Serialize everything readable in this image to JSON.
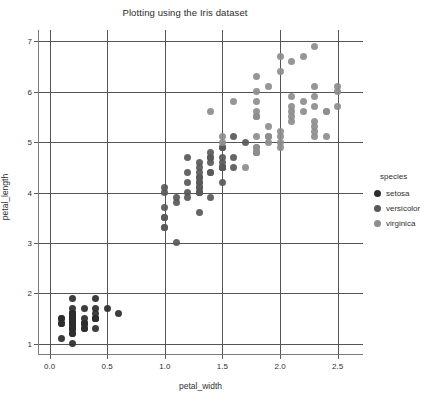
{
  "chart_data": {
    "type": "scatter",
    "title": "Plotting using the Iris dataset",
    "xlabel": "petal_width",
    "ylabel": "petal_length",
    "xlim": [
      -0.1,
      2.72
    ],
    "ylim": [
      0.78,
      7.22
    ],
    "xticks": [
      "0.0",
      "0.5",
      "1.0",
      "1.5",
      "2.0",
      "2.5"
    ],
    "xtick_values": [
      0.0,
      0.5,
      1.0,
      1.5,
      2.0,
      2.5
    ],
    "yticks": [
      "1",
      "2",
      "3",
      "4",
      "5",
      "6",
      "7"
    ],
    "ytick_values": [
      1,
      2,
      3,
      4,
      5,
      6,
      7
    ],
    "grid": true,
    "legend_position": "right",
    "legend_title": "species",
    "marker": "circle",
    "marker_size": 7,
    "series": [
      {
        "name": "setosa",
        "color": "#2d2d2d",
        "x": [
          0.2,
          0.2,
          0.2,
          0.2,
          0.2,
          0.4,
          0.3,
          0.2,
          0.2,
          0.1,
          0.2,
          0.2,
          0.1,
          0.1,
          0.2,
          0.4,
          0.4,
          0.3,
          0.3,
          0.3,
          0.2,
          0.4,
          0.2,
          0.5,
          0.2,
          0.2,
          0.4,
          0.2,
          0.2,
          0.2,
          0.2,
          0.4,
          0.1,
          0.2,
          0.2,
          0.2,
          0.2,
          0.1,
          0.2,
          0.2,
          0.3,
          0.3,
          0.2,
          0.6,
          0.4,
          0.3,
          0.2,
          0.2,
          0.2,
          0.2
        ],
        "y": [
          1.4,
          1.4,
          1.3,
          1.5,
          1.4,
          1.7,
          1.4,
          1.5,
          1.4,
          1.5,
          1.5,
          1.6,
          1.4,
          1.1,
          1.2,
          1.5,
          1.3,
          1.4,
          1.7,
          1.5,
          1.7,
          1.5,
          1.0,
          1.7,
          1.9,
          1.6,
          1.6,
          1.5,
          1.4,
          1.6,
          1.6,
          1.5,
          1.5,
          1.4,
          1.5,
          1.2,
          1.3,
          1.4,
          1.3,
          1.5,
          1.3,
          1.3,
          1.3,
          1.6,
          1.9,
          1.4,
          1.6,
          1.4,
          1.5,
          1.4
        ]
      },
      {
        "name": "versicolor",
        "color": "#595959",
        "x": [
          1.4,
          1.5,
          1.5,
          1.3,
          1.5,
          1.3,
          1.6,
          1.0,
          1.3,
          1.4,
          1.0,
          1.5,
          1.0,
          1.4,
          1.3,
          1.4,
          1.5,
          1.0,
          1.5,
          1.1,
          1.8,
          1.3,
          1.5,
          1.2,
          1.3,
          1.4,
          1.4,
          1.7,
          1.5,
          1.0,
          1.1,
          1.0,
          1.2,
          1.6,
          1.5,
          1.6,
          1.5,
          1.3,
          1.3,
          1.3,
          1.2,
          1.4,
          1.2,
          1.0,
          1.3,
          1.2,
          1.3,
          1.3,
          1.1,
          1.3
        ],
        "y": [
          4.7,
          4.5,
          4.9,
          4.0,
          4.6,
          4.5,
          4.7,
          3.3,
          4.6,
          3.9,
          3.5,
          4.2,
          4.0,
          4.7,
          3.6,
          4.4,
          4.5,
          4.1,
          4.5,
          3.9,
          4.8,
          4.0,
          4.9,
          4.7,
          4.3,
          4.4,
          4.8,
          5.0,
          4.5,
          3.5,
          3.8,
          3.7,
          3.9,
          5.1,
          4.5,
          4.5,
          4.7,
          4.4,
          4.1,
          4.0,
          4.4,
          4.6,
          4.0,
          3.3,
          4.2,
          4.2,
          4.2,
          4.3,
          3.0,
          4.1
        ]
      },
      {
        "name": "virginica",
        "color": "#8d8d8d",
        "x": [
          2.5,
          1.9,
          2.1,
          1.8,
          2.2,
          2.1,
          1.7,
          1.8,
          1.8,
          2.5,
          2.0,
          1.9,
          2.1,
          2.0,
          2.4,
          2.3,
          1.8,
          2.2,
          2.3,
          1.5,
          2.3,
          2.0,
          2.0,
          1.8,
          2.1,
          1.8,
          1.8,
          1.8,
          2.1,
          1.6,
          1.9,
          2.0,
          2.2,
          1.5,
          1.4,
          2.3,
          2.4,
          1.8,
          1.8,
          2.1,
          2.4,
          2.3,
          1.9,
          2.3,
          2.5,
          2.3,
          1.9,
          2.0,
          2.3,
          1.8
        ],
        "y": [
          6.0,
          5.1,
          5.9,
          5.6,
          5.8,
          6.6,
          4.5,
          6.3,
          5.8,
          6.1,
          5.1,
          5.3,
          5.5,
          5.0,
          5.1,
          5.3,
          5.5,
          6.7,
          6.9,
          5.0,
          5.7,
          4.9,
          6.7,
          4.9,
          5.7,
          6.0,
          4.8,
          4.9,
          5.6,
          5.8,
          6.1,
          6.4,
          5.6,
          5.1,
          5.6,
          6.1,
          5.6,
          5.5,
          4.8,
          5.4,
          5.6,
          5.1,
          5.1,
          5.9,
          5.7,
          5.2,
          5.0,
          5.2,
          5.4,
          5.1
        ]
      }
    ]
  }
}
